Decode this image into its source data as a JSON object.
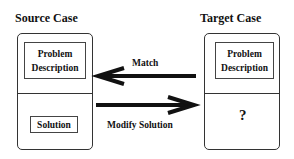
{
  "source_case": {
    "title": "Source Case",
    "problem_label": "Problem Description",
    "problem_line1": "Problem",
    "problem_line2": "Description",
    "solution_label": "Solution"
  },
  "target_case": {
    "title": "Target Case",
    "problem_line1": "Problem",
    "problem_line2": "Description",
    "solution_placeholder": "?"
  },
  "arrows": {
    "match": {
      "label": "Match",
      "direction": "target-to-source"
    },
    "modify": {
      "label": "Modify Solution",
      "direction": "source-to-target"
    }
  }
}
